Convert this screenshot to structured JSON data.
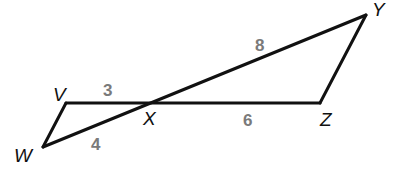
{
  "figure": {
    "colors": {
      "line": "#111111",
      "vertex_label": "#111111",
      "length_label": "#7a7a7a",
      "background": "#ffffff"
    },
    "vertices": {
      "V": {
        "label": "V",
        "x": 66,
        "y": 103
      },
      "W": {
        "label": "W",
        "x": 43,
        "y": 147
      },
      "X": {
        "label": "X",
        "x": 149,
        "y": 103
      },
      "Y": {
        "label": "Y",
        "x": 366,
        "y": 15
      },
      "Z": {
        "label": "Z",
        "x": 320,
        "y": 103
      }
    },
    "segments": [
      {
        "name": "VX",
        "length": "3"
      },
      {
        "name": "WX",
        "length": "4"
      },
      {
        "name": "XY",
        "length": "8"
      },
      {
        "name": "XZ",
        "length": "6"
      },
      {
        "name": "VW",
        "length": ""
      },
      {
        "name": "YZ",
        "length": ""
      }
    ],
    "labels": {
      "V": "V",
      "W": "W",
      "X": "X",
      "Y": "Y",
      "Z": "Z",
      "VX_length": "3",
      "WX_length": "4",
      "XY_length": "8",
      "XZ_length": "6"
    }
  }
}
